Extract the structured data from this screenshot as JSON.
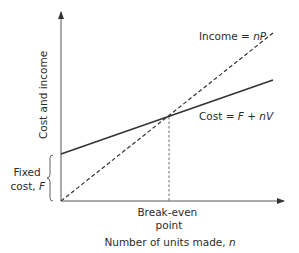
{
  "diagram": {
    "y_axis_label": "Cost and income",
    "x_axis_label_prefix": "Number of units made, ",
    "x_axis_label_var": "n",
    "income_line": {
      "label_prefix": "Income = ",
      "label_var": "nP",
      "style": "dashed"
    },
    "cost_line": {
      "label_prefix": "Cost = ",
      "label_var": "F + nV",
      "style": "solid"
    },
    "fixed_cost": {
      "line1": "Fixed",
      "line2_prefix": "cost, ",
      "line2_var": "F"
    },
    "break_even": {
      "line1": "Break-even",
      "line2": "point"
    },
    "colors": {
      "axis": "#555555",
      "line": "#333333",
      "text": "#2b2b2b",
      "background": "#ffffff"
    }
  }
}
